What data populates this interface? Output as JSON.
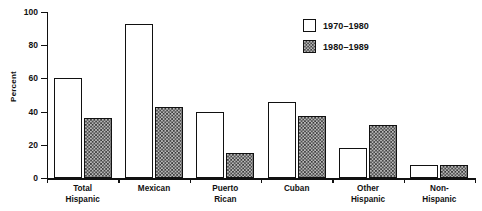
{
  "chart_data": {
    "type": "bar",
    "title": "",
    "xlabel": "",
    "ylabel": "Percent",
    "ylim": [
      0,
      100
    ],
    "yticks": [
      0,
      20,
      40,
      60,
      80,
      100
    ],
    "ytick_labels": [
      "0",
      "20",
      "40",
      "60",
      "80",
      "100"
    ],
    "grid": false,
    "legend_position": "top-right",
    "categories": [
      "Total\nHispanic",
      "Mexican",
      "Puerto\nRican",
      "Cuban",
      "Other\nHispanic",
      "Non-\nHispanic"
    ],
    "series": [
      {
        "name": "1970–1980",
        "fill": "white",
        "values": [
          60,
          93,
          40,
          46,
          18,
          8
        ]
      },
      {
        "name": "1980–1989",
        "fill": "checkered",
        "values": [
          36,
          43,
          15,
          37.5,
          32,
          8
        ]
      }
    ]
  },
  "legend": {
    "items": [
      {
        "label": "1970–1980",
        "swatch": "light"
      },
      {
        "label": "1980–1989",
        "swatch": "hatch"
      }
    ]
  },
  "colors": {
    "axis": "#111111",
    "series_1_fill": "#ffffff",
    "series_2_fill": "#b9b9b9",
    "background": "#ffffff"
  }
}
